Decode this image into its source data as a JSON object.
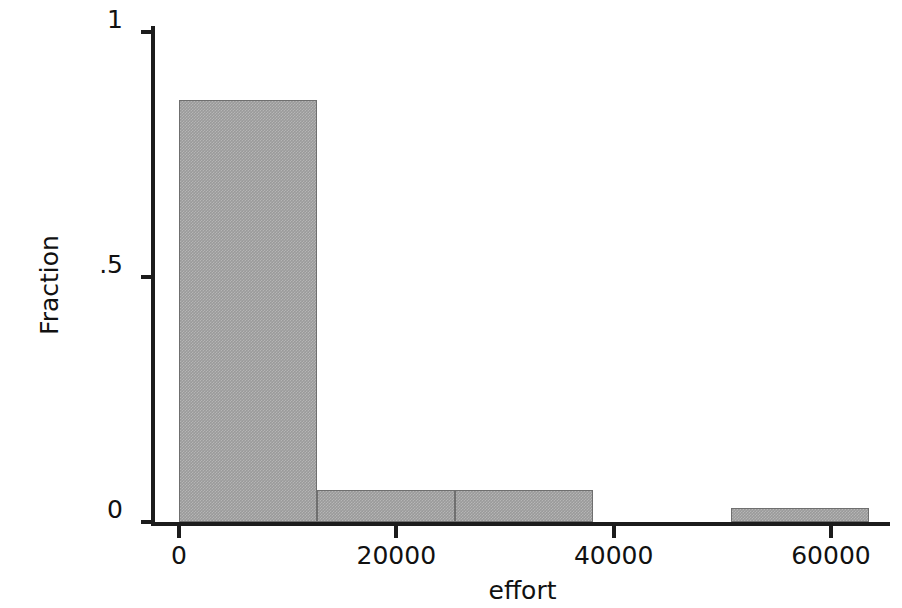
{
  "chart_data": {
    "type": "bar",
    "title": "",
    "subtitle": "",
    "xlabel": "effort",
    "ylabel": "Fraction",
    "xlim": [
      -1500,
      67500
    ],
    "ylim": [
      0,
      1
    ],
    "grid": false,
    "legend": null,
    "x_ticks": [
      {
        "value": 0,
        "label": "0"
      },
      {
        "value": 20000,
        "label": "20000"
      },
      {
        "value": 40000,
        "label": "40000"
      },
      {
        "value": 60000,
        "label": "60000"
      }
    ],
    "y_ticks": [
      {
        "value": 0,
        "label": "0"
      },
      {
        "value": 0.5,
        "label": ".5"
      },
      {
        "value": 1,
        "label": "1"
      }
    ],
    "bin_width": 12700,
    "categories": [
      "0-12700",
      "12700-25400",
      "25400-38100",
      "38100-50800",
      "50800-63500"
    ],
    "bin_edges": [
      0,
      12700,
      25400,
      38100,
      50800,
      63500
    ],
    "values": [
      0.861,
      0.065,
      0.065,
      0,
      0.029
    ],
    "bars": [
      {
        "label": "0-12700",
        "x0": 0,
        "x1": 12700,
        "value": 0.861
      },
      {
        "label": "12700-25400",
        "x0": 12700,
        "x1": 25400,
        "value": 0.065
      },
      {
        "label": "25400-38100",
        "x0": 25400,
        "x1": 38100,
        "value": 0.065
      },
      {
        "label": "38100-50800",
        "x0": 38100,
        "x1": 50800,
        "value": 0
      },
      {
        "label": "50800-63500",
        "x0": 50800,
        "x1": 63500,
        "value": 0.029
      }
    ],
    "bar_color": "#9a9a9a",
    "bar_edge_color": "#6f6f6f",
    "axis_color": "#1c1c1c",
    "background_color": "#ffffff"
  }
}
